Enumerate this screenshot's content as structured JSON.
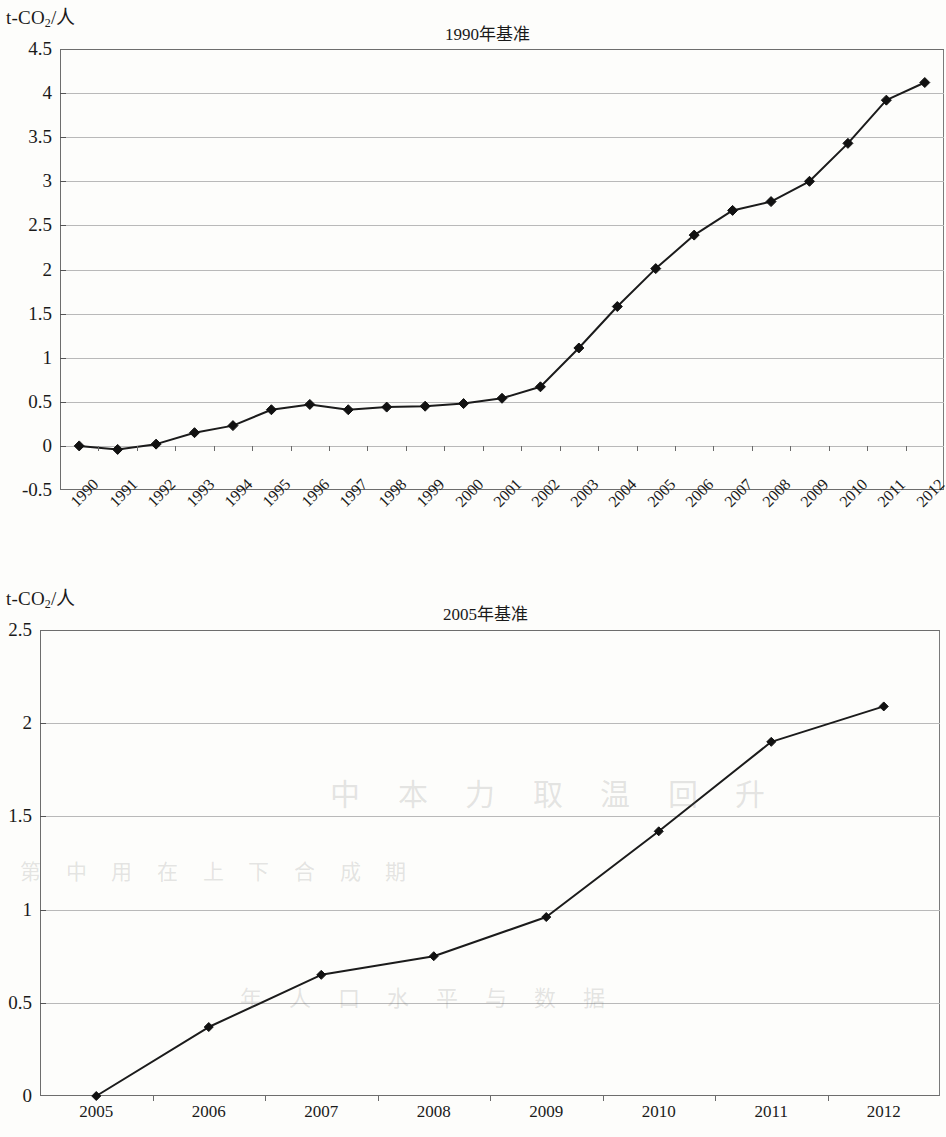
{
  "page": {
    "background_color": "#fdfdfb",
    "ink_color": "#1a1a1a",
    "grid_color": "#b9b9b9"
  },
  "chart_data": [
    {
      "id": "chart-1990",
      "type": "line",
      "title": "1990年基准",
      "ylabel": "t-CO2/人",
      "ylabel_html": "t-CO₂/人",
      "xlabel": "",
      "ylim": [
        -0.5,
        4.5
      ],
      "ytick_labels": [
        "4.5",
        "4",
        "3.5",
        "3",
        "2.5",
        "2",
        "1.5",
        "1",
        "0.5",
        "0",
        "-0.5"
      ],
      "ytick_values": [
        4.5,
        4,
        3.5,
        3,
        2.5,
        2,
        1.5,
        1,
        0.5,
        0,
        -0.5
      ],
      "grid": true,
      "legend": "none",
      "marker": "diamond",
      "categories": [
        "1990",
        "1991",
        "1992",
        "1993",
        "1994",
        "1995",
        "1996",
        "1997",
        "1998",
        "1999",
        "2000",
        "2001",
        "2002",
        "2003",
        "2004",
        "2005",
        "2006",
        "2007",
        "2008",
        "2009",
        "2010",
        "2011",
        "2012"
      ],
      "values": [
        0,
        -0.04,
        0.02,
        0.15,
        0.23,
        0.41,
        0.47,
        0.41,
        0.44,
        0.45,
        0.48,
        0.54,
        0.67,
        1.11,
        1.58,
        2.01,
        2.39,
        2.67,
        2.77,
        3.0,
        3.43,
        3.92,
        4.12
      ],
      "xtick_rotation_deg": -45
    },
    {
      "id": "chart-2005",
      "type": "line",
      "title": "2005年基准",
      "ylabel": "t-CO2/人",
      "ylabel_html": "t-CO₂/人",
      "xlabel": "",
      "ylim": [
        0,
        2.5
      ],
      "ytick_labels": [
        "2.5",
        "2",
        "1.5",
        "1",
        "0.5",
        "0"
      ],
      "ytick_values": [
        2.5,
        2,
        1.5,
        1,
        0.5,
        0
      ],
      "grid": true,
      "legend": "none",
      "marker": "diamond",
      "categories": [
        "2005",
        "2006",
        "2007",
        "2008",
        "2009",
        "2010",
        "2011",
        "2012"
      ],
      "values": [
        0,
        0.37,
        0.65,
        0.75,
        0.96,
        1.42,
        1.9,
        2.09
      ],
      "xtick_rotation_deg": 0
    }
  ],
  "ghost_text": [
    "中 本 力 取 温 回 升",
    "第 中 用 在 上 下 合 成 期",
    "年 人 口 水 平 与 数 据"
  ]
}
